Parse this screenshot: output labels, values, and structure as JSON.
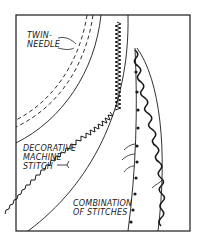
{
  "figure": {
    "type": "hand-drawn illustration",
    "stroke_color": "#1a1a1a",
    "background": "#ffffff"
  },
  "labels": {
    "twin_needle": {
      "line1": "TWIN-",
      "line2": "NEEDLE"
    },
    "decorative": {
      "line1": "DECORATIVE",
      "line2": "MACHINE",
      "line3": "STITCH"
    },
    "combination": {
      "line1": "COMBINATION",
      "line2": "OF STITCHES"
    }
  }
}
